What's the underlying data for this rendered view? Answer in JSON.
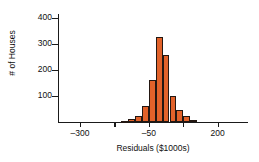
{
  "chart_data": {
    "type": "bar",
    "title": "",
    "xlabel": "Residuals ($1000s)",
    "ylabel": "# of Houses",
    "xlim": [
      -380,
      310
    ],
    "ylim": [
      0,
      415
    ],
    "xticks": [
      -300,
      -50,
      200
    ],
    "xtick_labels": [
      "–300",
      "–50",
      "200"
    ],
    "xminor_ticks": [
      -425,
      -175,
      75,
      325
    ],
    "yticks": [
      100,
      200,
      300,
      400
    ],
    "ytick_labels": [
      "100",
      "200",
      "300",
      "400"
    ],
    "grid": false,
    "legend": null,
    "bar_color": "#e2622a",
    "bar_edge_color": "#231712",
    "bin_width": 25,
    "categories": [
      -150,
      -125,
      -100,
      -75,
      -50,
      -25,
      0,
      25,
      50,
      75,
      100
    ],
    "values": [
      4,
      10,
      22,
      62,
      163,
      325,
      258,
      102,
      45,
      22,
      8
    ],
    "bins": [
      {
        "left": -150,
        "right": -125,
        "count": 4
      },
      {
        "left": -125,
        "right": -100,
        "count": 10
      },
      {
        "left": -100,
        "right": -75,
        "count": 22
      },
      {
        "left": -75,
        "right": -50,
        "count": 62
      },
      {
        "left": -50,
        "right": -25,
        "count": 163
      },
      {
        "left": -25,
        "right": 0,
        "count": 325
      },
      {
        "left": 0,
        "right": 25,
        "count": 258
      },
      {
        "left": 25,
        "right": 50,
        "count": 102
      },
      {
        "left": 50,
        "right": 75,
        "count": 45
      },
      {
        "left": 75,
        "right": 100,
        "count": 22
      },
      {
        "left": 100,
        "right": 125,
        "count": 8
      }
    ]
  }
}
